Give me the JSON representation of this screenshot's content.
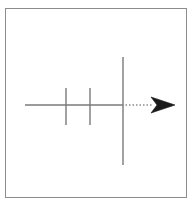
{
  "figure": {
    "title": "",
    "background_color": "#ffffff",
    "frame": {
      "name": "outer-border",
      "x": 5,
      "y": 8,
      "width": 182,
      "height": 190,
      "stroke": "#8c8c8c",
      "stroke_width": 1
    },
    "colors": {
      "line": "#7a7a7a",
      "dotted": "#8a8a8a",
      "arrowhead": "#1a1a1a",
      "frame": "#8c8c8c",
      "background": "#ffffff"
    },
    "axis": {
      "name": "horizontal-axis",
      "y": 105,
      "solid_segment": {
        "x1": 25,
        "x2": 122
      },
      "dotted_segment": {
        "x1": 122,
        "x2": 153,
        "dash": "1.5 2"
      },
      "stroke_width": 1.4
    },
    "arrowhead": {
      "name": "arrow-head",
      "tip_x": 175,
      "tip_y": 105,
      "back_x": 151,
      "half_height": 8,
      "notch_depth": 6,
      "fill": "#1a1a1a"
    },
    "ticks": [
      {
        "label": "tick-1",
        "x": 66,
        "y_top": 88,
        "y_bottom": 125,
        "stroke_width": 1.4
      },
      {
        "label": "tick-2",
        "x": 90,
        "y_top": 88,
        "y_bottom": 125,
        "stroke_width": 1.4
      }
    ],
    "major_line": {
      "name": "major-vertical-line",
      "x": 123,
      "y_top": 57,
      "y_bottom": 165,
      "stroke_width": 1.4
    }
  }
}
